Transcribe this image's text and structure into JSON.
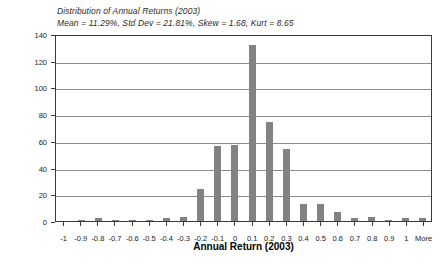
{
  "chart_data": {
    "type": "bar",
    "title": "Distribution of Annual Returns (2003)",
    "subtitle": "Mean = 11.29%, Std Dev = 21.81%, Skew = 1.68, Kurt = 8.65",
    "xlabel": "Annual Return (2003)",
    "ylabel": "Frequency",
    "ylim": [
      0,
      140
    ],
    "yticks": [
      0,
      20,
      40,
      60,
      80,
      100,
      120,
      140
    ],
    "grid": true,
    "legend": "none",
    "bar_color": "#828282",
    "categories": [
      "-1",
      "-0.9",
      "-0.8",
      "-0.7",
      "-0.6",
      "-0.5",
      "-0.4",
      "-0.3",
      "-0.2",
      "-0.1",
      "0",
      "0.1",
      "0.2",
      "0.3",
      "0.4",
      "0.5",
      "0.6",
      "0.7",
      "0.8",
      "0.9",
      "1",
      "More"
    ],
    "values": [
      0,
      1,
      2,
      1,
      1,
      1,
      2,
      3,
      24,
      56,
      57,
      132,
      74,
      54,
      13,
      13,
      7,
      2,
      3,
      1,
      2,
      2
    ]
  },
  "stats": {
    "mean": "11.29%",
    "std_dev": "21.81%",
    "skew": "1.68",
    "kurt": "8.65"
  }
}
